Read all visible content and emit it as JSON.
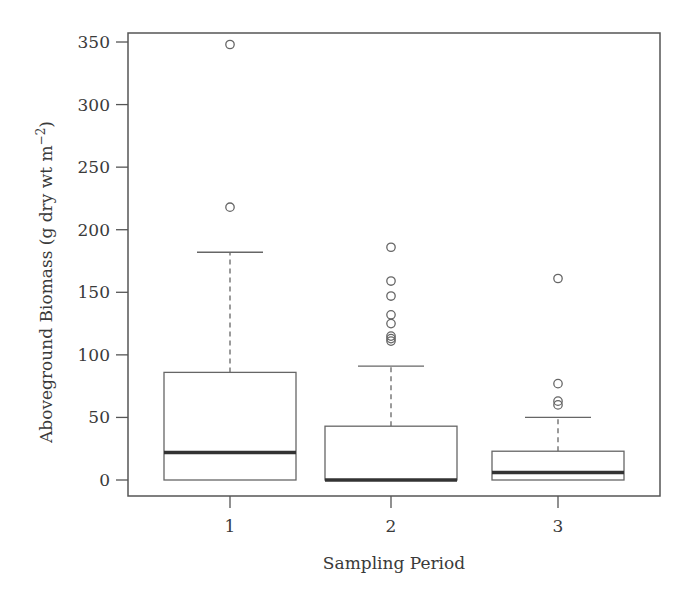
{
  "chart_data": {
    "type": "boxplot",
    "title": "",
    "xlabel": "Sampling Period",
    "ylabel": "Aboveground Biomass (g dry wt m",
    "ylabel_superscript": "−2",
    "ylabel_suffix": ")",
    "ylim": [
      -13,
      362
    ],
    "yticks": [
      0,
      50,
      100,
      150,
      200,
      250,
      300,
      350
    ],
    "categories": [
      "1",
      "2",
      "3"
    ],
    "grid": false,
    "legend": null,
    "boxes": [
      {
        "category": "1",
        "whisker_low": 0,
        "q1": 0,
        "median": 22,
        "q3": 86,
        "whisker_high": 182,
        "outliers": [
          348,
          218
        ]
      },
      {
        "category": "2",
        "whisker_low": 0,
        "q1": 0,
        "median": 0,
        "q3": 43,
        "whisker_high": 91,
        "outliers": [
          186,
          159,
          147,
          132,
          125,
          115,
          113,
          111
        ]
      },
      {
        "category": "3",
        "whisker_low": 0,
        "q1": 0,
        "median": 6,
        "q3": 23,
        "whisker_high": 50,
        "outliers": [
          161,
          77,
          63,
          60
        ]
      }
    ]
  },
  "colors": {
    "frame": "#555555",
    "box": "#666666",
    "median": "#333333",
    "text": "#3a3a3a"
  }
}
